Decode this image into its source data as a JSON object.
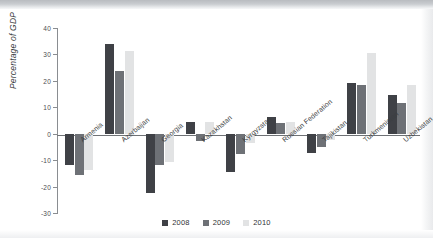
{
  "chart_data": {
    "type": "bar",
    "title": "",
    "subtitle": "",
    "xlabel": "",
    "ylabel": "Percentage of GDP",
    "ylim": [
      -30,
      40
    ],
    "yticks": [
      40,
      30,
      20,
      10,
      0,
      -10,
      -20,
      -30
    ],
    "ytick_labels": [
      "40",
      "30",
      "20",
      "10",
      "0",
      "-10",
      "-20",
      "-30"
    ],
    "grid": false,
    "legend_position": "bottom",
    "categories": [
      "Armenia",
      "Azerbaijan",
      "Georgia",
      "Kazakhstan",
      "Kyrgyzstan",
      "Russian Federation",
      "Tajikistan",
      "Turkmenistan",
      "Uzbekistan"
    ],
    "series": [
      {
        "name": "2008",
        "color": "#3f4146",
        "values": [
          -11.9,
          33.8,
          -22.3,
          4.5,
          -14.5,
          6.3,
          -7.2,
          19.2,
          14.7
        ]
      },
      {
        "name": "2009",
        "color": "#6e7176",
        "values": [
          -15.6,
          23.7,
          -11.7,
          -2.8,
          -7.5,
          4.1,
          -5.0,
          18.3,
          11.6
        ]
      },
      {
        "name": "2010",
        "color": "#e2e3e4",
        "values": [
          -13.6,
          31.4,
          -10.8,
          4.3,
          -3.5,
          4.6,
          -2.5,
          30.5,
          18.4
        ]
      }
    ]
  },
  "legend": {
    "items": [
      {
        "label": "2008"
      },
      {
        "label": "2009"
      },
      {
        "label": "2010"
      }
    ]
  },
  "colors": {
    "series_2008": "#3f4146",
    "series_2009": "#6e7176",
    "series_2010": "#e2e3e4",
    "axis": "#6f7276",
    "text": "#3b3e42",
    "background": "#ffffff"
  }
}
